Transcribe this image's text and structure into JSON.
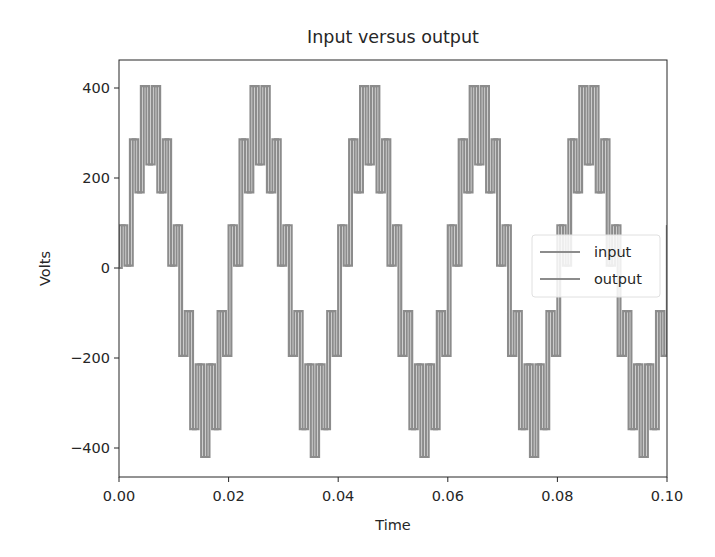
{
  "chart_data": {
    "type": "line",
    "title": "Input versus output",
    "xlabel": "Time",
    "ylabel": "Volts",
    "xlim": [
      0.0,
      0.1
    ],
    "ylim": [
      -460,
      460
    ],
    "x_ticks": [
      "0.00",
      "0.02",
      "0.04",
      "0.06",
      "0.08",
      "0.10"
    ],
    "x_tick_values": [
      0.0,
      0.02,
      0.04,
      0.06,
      0.08,
      0.1
    ],
    "y_ticks": [
      "400",
      "200",
      "0",
      "−200",
      "−400"
    ],
    "y_tick_values": [
      400,
      200,
      0,
      -200,
      -400
    ],
    "grid": false,
    "legend_position": "center right",
    "legend": [
      "input",
      "output"
    ],
    "colors": {
      "input": "#8c8c8c",
      "output": "#8c8c8c",
      "axes": "#262626"
    },
    "model": {
      "description": "50 Hz sine of amplitude 325 V plus a +/-95 V sample-and-hold ripple alternating every 1 ms; output is input delayed by 0.5 ms",
      "fundamental_hz": 50,
      "amplitude": 325,
      "ripple_amplitude": 95,
      "hold_step_s": 0.001,
      "output_delay_s": 0.0005
    },
    "x": [
      0.0,
      0.001,
      0.002,
      0.003,
      0.004,
      0.005,
      0.006,
      0.007,
      0.008,
      0.009,
      0.01,
      0.011,
      0.012,
      0.013,
      0.014,
      0.015,
      0.016,
      0.017,
      0.018,
      0.019,
      0.02
    ],
    "series": [
      {
        "name": "input",
        "period_values": [
          95,
          5.4,
          286,
          167.9,
          404.1,
          230,
          404.1,
          167.9,
          286,
          5.4,
          95,
          -195.4,
          -96,
          -357.9,
          -214.1,
          -420,
          -214.1,
          -357.9,
          -96,
          -195.4,
          95
        ],
        "note": "values repeat every 0.02 s for 5 periods across 0 to 0.1 s"
      },
      {
        "name": "output",
        "period_values": [
          95,
          5.4,
          286,
          167.9,
          404.1,
          230,
          404.1,
          167.9,
          286,
          5.4,
          95,
          -195.4,
          -96,
          -357.9,
          -214.1,
          -420,
          -214.1,
          -357.9,
          -96,
          -195.4,
          95
        ],
        "note": "same shape as input, shifted +0.0005 s"
      }
    ]
  },
  "legend": {
    "items": [
      {
        "label": "input"
      },
      {
        "label": "output"
      }
    ]
  }
}
